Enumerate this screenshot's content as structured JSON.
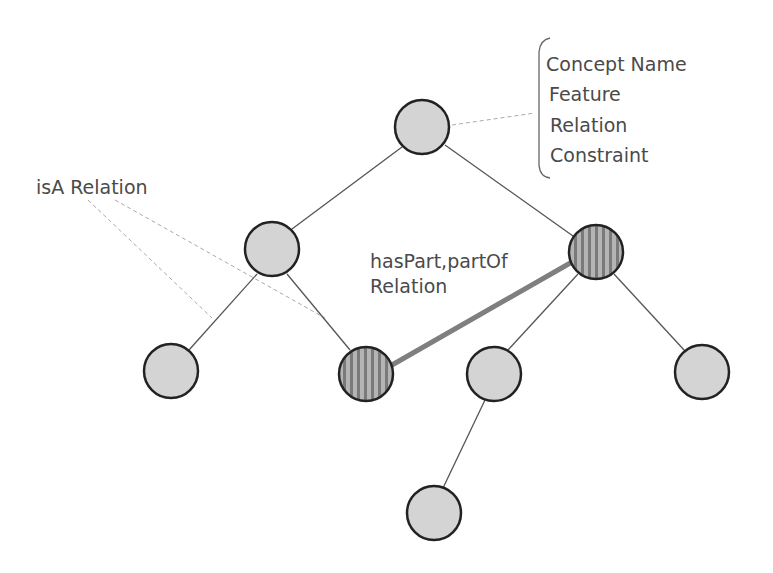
{
  "diagram": {
    "colors": {
      "node_fill": "#d4d4d4",
      "node_stroke": "#222222",
      "striped_fill": "#a8a8a8",
      "stripe_dark": "#777777",
      "edge": "#555555",
      "part_edge": "#7f7f7f",
      "annotation_line": "#aaaaaa",
      "text": "#4a4a4a"
    },
    "concept_box": {
      "lines": [
        "Concept Name",
        "Feature",
        "Relation",
        "Constraint"
      ]
    },
    "isa_label": "isA Relation",
    "haspart_label": {
      "line1": "hasPart,partOf",
      "line2": "Relation"
    },
    "nodes": [
      {
        "id": "root",
        "x": 422,
        "y": 127,
        "style": "plain"
      },
      {
        "id": "l1-left",
        "x": 272,
        "y": 249,
        "style": "plain"
      },
      {
        "id": "l1-right",
        "x": 596,
        "y": 252,
        "style": "striped"
      },
      {
        "id": "l2-a",
        "x": 171,
        "y": 371,
        "style": "plain"
      },
      {
        "id": "l2-b",
        "x": 366,
        "y": 374,
        "style": "striped"
      },
      {
        "id": "l2-c",
        "x": 494,
        "y": 374,
        "style": "plain"
      },
      {
        "id": "l2-d",
        "x": 702,
        "y": 372,
        "style": "plain"
      },
      {
        "id": "l3-a",
        "x": 434,
        "y": 513,
        "style": "plain"
      }
    ],
    "edges": [
      {
        "from": "root",
        "to": "l1-left",
        "type": "isA"
      },
      {
        "from": "root",
        "to": "l1-right",
        "type": "isA"
      },
      {
        "from": "l1-left",
        "to": "l2-a",
        "type": "isA"
      },
      {
        "from": "l1-left",
        "to": "l2-b",
        "type": "isA"
      },
      {
        "from": "l1-right",
        "to": "l2-c",
        "type": "isA"
      },
      {
        "from": "l1-right",
        "to": "l2-d",
        "type": "isA"
      },
      {
        "from": "l2-c",
        "to": "l3-a",
        "type": "isA"
      },
      {
        "from": "l2-b",
        "to": "l1-right",
        "type": "hasPart"
      }
    ]
  }
}
